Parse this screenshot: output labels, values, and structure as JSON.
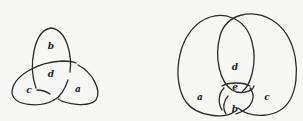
{
  "diagrams": [
    {
      "name": "trefoil-knot",
      "regions": [
        {
          "label": "b",
          "x": 51,
          "y": 49
        },
        {
          "label": "d",
          "x": 51,
          "y": 77
        },
        {
          "label": "c",
          "x": 29,
          "y": 93
        },
        {
          "label": "a",
          "x": 78,
          "y": 92
        }
      ]
    },
    {
      "name": "hopf-like-link",
      "regions": [
        {
          "label": "d",
          "x": 235,
          "y": 70
        },
        {
          "label": "e",
          "x": 235,
          "y": 90
        },
        {
          "label": "a",
          "x": 200,
          "y": 100
        },
        {
          "label": "c",
          "x": 267,
          "y": 100
        },
        {
          "label": "b",
          "x": 235,
          "y": 112
        }
      ]
    }
  ],
  "colors": {
    "stroke": "#2a2a2a",
    "background": "#f7f7f5"
  }
}
